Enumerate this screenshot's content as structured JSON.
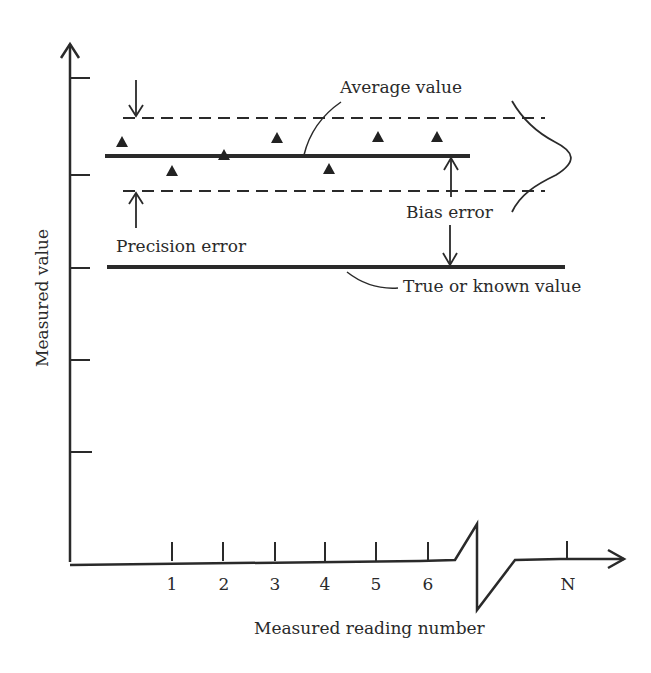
{
  "diagram": {
    "type": "measurement-error-illustration",
    "labels": {
      "y_axis": "Measured value",
      "x_axis": "Measured reading number",
      "average_value": "Average value",
      "bias_error": "Bias error",
      "precision_error": "Precision error",
      "true_value": "True or known value"
    },
    "x_ticks": [
      "1",
      "2",
      "3",
      "4",
      "5",
      "6",
      "N"
    ],
    "readings": [
      {
        "reading": 0,
        "relative_value": "above average"
      },
      {
        "reading": 1,
        "relative_value": "below average"
      },
      {
        "reading": 2,
        "relative_value": "on average"
      },
      {
        "reading": 3,
        "relative_value": "above average"
      },
      {
        "reading": 4,
        "relative_value": "below average"
      },
      {
        "reading": 5,
        "relative_value": "above average"
      },
      {
        "reading": 6,
        "relative_value": "above average"
      }
    ],
    "colors": {
      "line": "#2a2a2a",
      "background": "#ffffff"
    }
  }
}
